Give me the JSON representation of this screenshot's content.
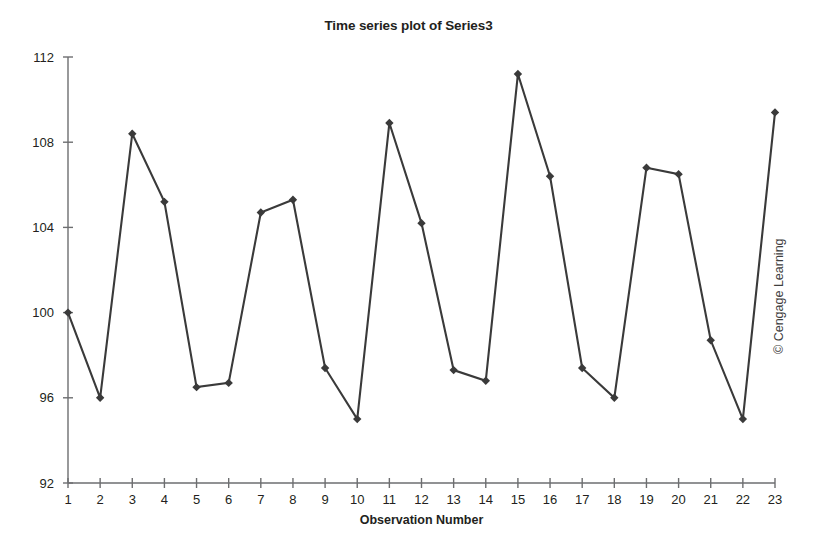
{
  "chart_data": {
    "type": "line",
    "title": "Time series plot of Series3",
    "xlabel": "Observation Number",
    "ylabel": "Series3",
    "grid": false,
    "legend": null,
    "marker": "diamond",
    "line_color": "#3a3a3a",
    "xlim": [
      1,
      23
    ],
    "ylim": [
      92,
      112
    ],
    "x_ticks": [
      1,
      2,
      3,
      4,
      5,
      6,
      7,
      8,
      9,
      10,
      11,
      12,
      13,
      14,
      15,
      16,
      17,
      18,
      19,
      20,
      21,
      22,
      23
    ],
    "y_ticks": [
      92,
      96,
      100,
      104,
      108,
      112
    ],
    "x": [
      1,
      2,
      3,
      4,
      5,
      6,
      7,
      8,
      9,
      10,
      11,
      12,
      13,
      14,
      15,
      16,
      17,
      18,
      19,
      20,
      21,
      22,
      23
    ],
    "values": [
      100.0,
      96.0,
      108.4,
      105.2,
      96.5,
      96.7,
      104.7,
      105.3,
      97.4,
      95.0,
      108.9,
      104.2,
      97.3,
      96.8,
      111.2,
      106.4,
      97.4,
      96.0,
      106.8,
      106.5,
      98.7,
      95.0,
      109.4
    ],
    "series": [
      {
        "name": "Series3",
        "values": [
          100.0,
          96.0,
          108.4,
          105.2,
          96.5,
          96.7,
          104.7,
          105.3,
          97.4,
          95.0,
          108.9,
          104.2,
          97.3,
          96.8,
          111.2,
          106.4,
          97.4,
          96.0,
          106.8,
          106.5,
          98.7,
          95.0,
          109.4
        ]
      }
    ]
  },
  "annotations": {
    "copyright": "© Cengage Learning"
  }
}
